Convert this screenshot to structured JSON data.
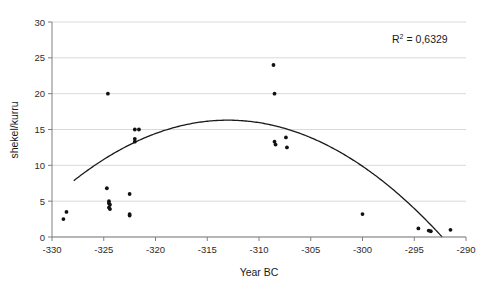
{
  "chart_data": {
    "type": "scatter",
    "title": "",
    "xlabel": "Year BC",
    "ylabel": "shekel/kurru",
    "xlim": [
      -330,
      -290
    ],
    "ylim": [
      0,
      30
    ],
    "xticks": [
      -330,
      -325,
      -320,
      -315,
      -310,
      -305,
      -300,
      -295,
      -290
    ],
    "xtick_labels": [
      "-330",
      "-325",
      "-320",
      "-315",
      "-310",
      "-305",
      "-300",
      "-295",
      "-290"
    ],
    "yticks": [
      0,
      5,
      10,
      15,
      20,
      25,
      30
    ],
    "ytick_labels": [
      "0",
      "5",
      "10",
      "15",
      "20",
      "25",
      "30"
    ],
    "grid": "horizontal",
    "legend": "none",
    "marker_color": "#111111",
    "line_color": "#1a1a1a",
    "grid_color": "#d9d9d9",
    "axis_color": "#808080",
    "points": [
      {
        "x": -328.6,
        "y": 3.5
      },
      {
        "x": -328.9,
        "y": 2.5
      },
      {
        "x": -324.6,
        "y": 20.0
      },
      {
        "x": -324.7,
        "y": 6.8
      },
      {
        "x": -324.5,
        "y": 5.0
      },
      {
        "x": -324.5,
        "y": 4.7
      },
      {
        "x": -324.4,
        "y": 4.5
      },
      {
        "x": -324.5,
        "y": 4.1
      },
      {
        "x": -324.4,
        "y": 3.9
      },
      {
        "x": -322.5,
        "y": 6.0
      },
      {
        "x": -322.5,
        "y": 3.2
      },
      {
        "x": -322.5,
        "y": 3.0
      },
      {
        "x": -322.0,
        "y": 15.0
      },
      {
        "x": -321.6,
        "y": 15.0
      },
      {
        "x": -322.0,
        "y": 13.7
      },
      {
        "x": -322.0,
        "y": 13.3
      },
      {
        "x": -308.6,
        "y": 24.0
      },
      {
        "x": -308.5,
        "y": 20.0
      },
      {
        "x": -308.5,
        "y": 13.3
      },
      {
        "x": -308.4,
        "y": 12.9
      },
      {
        "x": -307.4,
        "y": 13.9
      },
      {
        "x": -307.3,
        "y": 12.5
      },
      {
        "x": -300.0,
        "y": 3.2
      },
      {
        "x": -294.6,
        "y": 1.2
      },
      {
        "x": -293.6,
        "y": 0.9
      },
      {
        "x": -293.4,
        "y": 0.8
      },
      {
        "x": -291.5,
        "y": 1.0
      }
    ],
    "trend": {
      "type": "polynomial-2",
      "vertex_x": -313.0,
      "vertex_y": 16.3,
      "x_start": -327.9,
      "x_end": -292.3,
      "r_squared_label": "R",
      "r_squared_sup": "2",
      "r_squared_value": "= 0,6329"
    },
    "annotation": "R2 = 0,6329"
  }
}
